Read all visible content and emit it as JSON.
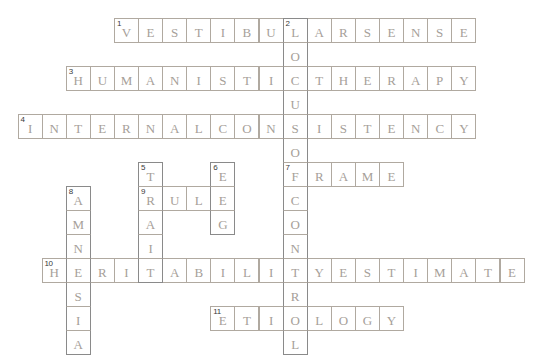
{
  "puzzle": {
    "type": "crossword",
    "grid": {
      "rows": 14,
      "cols": 21,
      "cell_width": 24.1,
      "cell_height": 24,
      "origin_x": 17.5,
      "origin_y": 18
    },
    "colors": {
      "background": "#ffffff",
      "cell_fill": "#ffffff",
      "across_border": "#b0a9a0",
      "down_border": "#8a8a8a",
      "letter": "#a6a099",
      "number": "#3a3a3a"
    },
    "entries": [
      {
        "number": 1,
        "answer": "VESTIBULARSENSE",
        "direction": "across",
        "row": 0,
        "col": 4
      },
      {
        "number": 2,
        "answer": "LOCUSOFCONTROL",
        "direction": "down",
        "row": 0,
        "col": 11
      },
      {
        "number": 3,
        "answer": "HUMANISTICTHERAPY",
        "direction": "across",
        "row": 2,
        "col": 2
      },
      {
        "number": 4,
        "answer": "INTERNALCONSISTENCY",
        "direction": "across",
        "row": 4,
        "col": 0
      },
      {
        "number": 5,
        "answer": "TRAIT",
        "direction": "down",
        "row": 6,
        "col": 5
      },
      {
        "number": 6,
        "answer": "EEG",
        "direction": "down",
        "row": 6,
        "col": 8
      },
      {
        "number": 7,
        "answer": "FRAME",
        "direction": "across",
        "row": 6,
        "col": 11
      },
      {
        "number": 8,
        "answer": "AMNESIA",
        "direction": "down",
        "row": 7,
        "col": 2
      },
      {
        "number": 9,
        "answer": "RULE",
        "direction": "across",
        "row": 7,
        "col": 5
      },
      {
        "number": 10,
        "answer": "HERITABILITYESTIMATE",
        "direction": "across",
        "row": 10,
        "col": 1
      },
      {
        "number": 11,
        "answer": "ETIOLOGY",
        "direction": "across",
        "row": 12,
        "col": 8
      }
    ]
  }
}
